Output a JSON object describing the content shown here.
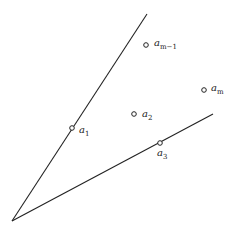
{
  "diagram": {
    "type": "cone-with-points",
    "vertex": {
      "x": 12,
      "y": 221
    },
    "rays": [
      {
        "name": "upper-ray",
        "end": {
          "x": 147,
          "y": 14
        }
      },
      {
        "name": "lower-ray",
        "end": {
          "x": 213,
          "y": 114
        }
      }
    ],
    "points": [
      {
        "name": "a1",
        "base": "a",
        "sub": "1",
        "x": 72,
        "y": 128,
        "lx": 79,
        "ly": 133
      },
      {
        "name": "a2",
        "base": "a",
        "sub": "2",
        "x": 134,
        "y": 114,
        "lx": 142,
        "ly": 117
      },
      {
        "name": "a3",
        "base": "a",
        "sub": "3",
        "x": 160,
        "y": 143,
        "lx": 157,
        "ly": 156
      },
      {
        "name": "am-1",
        "base": "a",
        "sub": "m−1",
        "x": 146,
        "y": 45,
        "lx": 154,
        "ly": 46
      },
      {
        "name": "am",
        "base": "a",
        "sub": "m",
        "x": 204,
        "y": 90,
        "lx": 211,
        "ly": 91
      }
    ],
    "colors": {
      "line": "#222222",
      "point": "#222222",
      "background": "#ffffff"
    }
  }
}
